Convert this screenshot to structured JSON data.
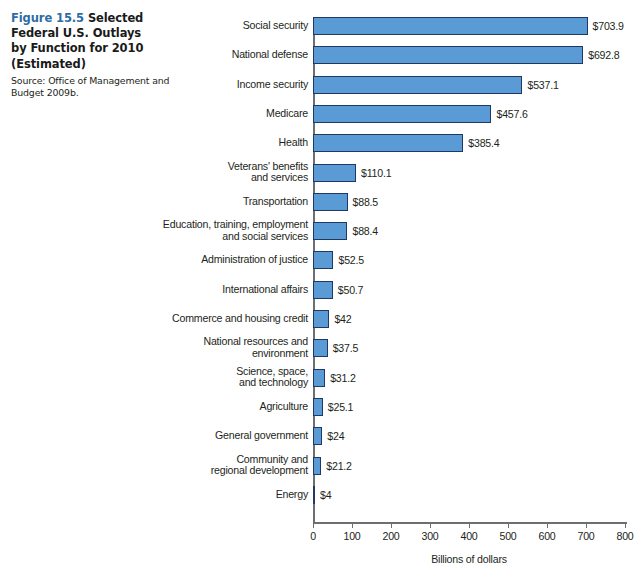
{
  "caption": {
    "figure_number": "Figure 15.5",
    "title": "Selected Federal U.S. Outlays by Function for 2010 (Estimated)",
    "title_line1": "Selected",
    "title_line2": "Federal U.S. Outlays",
    "title_line3": "by Function for 2010",
    "title_line4": "(Estimated)",
    "source_line1": "Source: Office of Management and",
    "source_line2": "Budget 2009b.",
    "accent_color": "#2e6ca4"
  },
  "chart_data": {
    "type": "bar",
    "orientation": "horizontal",
    "title": "Selected Federal U.S. Outlays by Function for 2010 (Estimated)",
    "xlabel": "Billions of dollars",
    "ylabel": "",
    "xlim": [
      0,
      800
    ],
    "xticks": [
      0,
      100,
      200,
      300,
      400,
      500,
      600,
      700,
      800
    ],
    "xtick_labels": [
      "0",
      "100",
      "200",
      "300",
      "400",
      "500",
      "600",
      "700",
      "800"
    ],
    "grid": false,
    "legend": false,
    "bar_color": "#5b9bd5",
    "bar_edge_color": "#1f3864",
    "categories": [
      "Social security",
      "National defense",
      "Income security",
      "Medicare",
      "Health",
      "Veterans' benefits\nand services",
      "Transportation",
      "Education, training, employment\nand social services",
      "Administration of justice",
      "International affairs",
      "Commerce and housing credit",
      "National resources and\nenvironment",
      "Science, space,\nand technology",
      "Agriculture",
      "General government",
      "Community and\nregional development",
      "Energy"
    ],
    "values": [
      703.9,
      692.8,
      537.1,
      457.6,
      385.4,
      110.1,
      88.5,
      88.4,
      52.5,
      50.7,
      42,
      37.5,
      31.2,
      25.1,
      24,
      21.2,
      4
    ],
    "value_labels": [
      "$703.9",
      "$692.8",
      "$537.1",
      "$457.6",
      "$385.4",
      "$110.1",
      "$88.5",
      "$88.4",
      "$52.5",
      "$50.7",
      "$42",
      "$37.5",
      "$31.2",
      "$25.1",
      "$24",
      "$21.2",
      "$4"
    ]
  }
}
